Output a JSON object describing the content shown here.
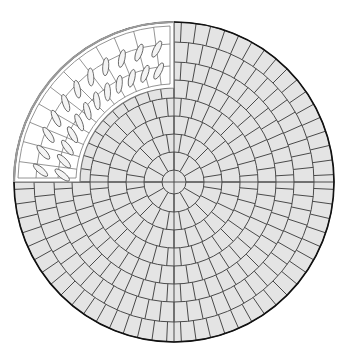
{
  "diagram": {
    "center": [
      174,
      182
    ],
    "outer_radius": 160,
    "ring_radii": [
      12,
      30,
      48,
      66,
      84,
      102,
      120,
      140,
      160
    ],
    "ring_segments": [
      4,
      12,
      20,
      28,
      36,
      44,
      52,
      60,
      68
    ],
    "colors": {
      "paver_fill": "#e4e4e4",
      "joint_line": "#4a4a4a",
      "outer_edge": "#111111",
      "quadrant_fill": "#ffffff",
      "quadrant_line": "#7a7a7a",
      "leaf_line": "#555555",
      "leaf_fill": "#f4f4f4"
    },
    "cutout_quadrant": {
      "label": "planting quadrant (top-left)",
      "inner_radius": 94,
      "outer_radius": 160,
      "border_gap": 4,
      "inner_rings": [
        116,
        138
      ],
      "segments": 12
    }
  }
}
